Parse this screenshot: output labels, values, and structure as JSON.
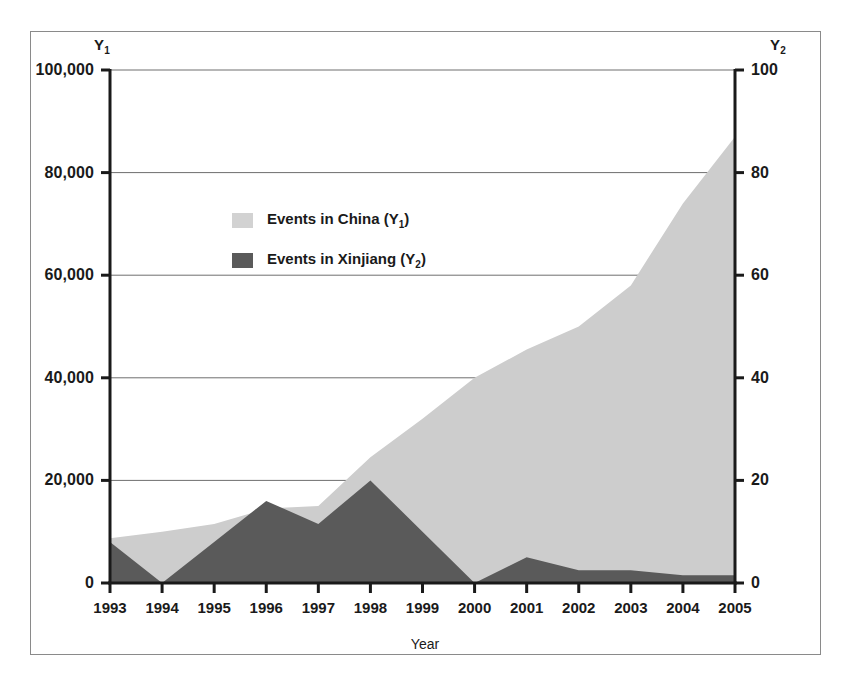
{
  "figure": {
    "background": "#ffffff",
    "frame_color": "#8a8a8a"
  },
  "axes": {
    "y1_title": "Y",
    "y1_title_sub": "1",
    "y2_title": "Y",
    "y2_title_sub": "2",
    "x_label": "Year",
    "y1_ticks": [
      "0",
      "20,000",
      "40,000",
      "60,000",
      "80,000",
      "100,000"
    ],
    "y2_ticks": [
      "0",
      "20",
      "40",
      "60",
      "80",
      "100"
    ],
    "x_ticks": [
      "1993",
      "1994",
      "1995",
      "1996",
      "1997",
      "1998",
      "1999",
      "2000",
      "2001",
      "2002",
      "2003",
      "2004",
      "2005"
    ]
  },
  "legend": {
    "items": [
      {
        "label_prefix": "Events in China (Y",
        "label_sub": "1",
        "label_suffix": ")",
        "color": "#d2d2d2"
      },
      {
        "label_prefix": "Events in Xinjiang (Y",
        "label_sub": "2",
        "label_suffix": ")",
        "color": "#5a5a5a"
      }
    ]
  },
  "colors": {
    "china_fill": "#cdcdcd",
    "xinjiang_fill": "#5a5a5a",
    "axis_line": "#1a1a1a",
    "grid_line": "#6e6e6e"
  },
  "chart_data": {
    "type": "area",
    "title": "",
    "xlabel": "Year",
    "ylabel": "",
    "grid": true,
    "legend_position": "inside-upper-left",
    "x": [
      1993,
      1994,
      1995,
      1996,
      1997,
      1998,
      1999,
      2000,
      2001,
      2002,
      2003,
      2004,
      2005
    ],
    "categories": [
      "1993",
      "1994",
      "1995",
      "1996",
      "1997",
      "1998",
      "1999",
      "2000",
      "2001",
      "2002",
      "2003",
      "2004",
      "2005"
    ],
    "y1_axis": {
      "label": "Y1",
      "ticks": [
        0,
        20000,
        40000,
        60000,
        80000,
        100000
      ],
      "ylim": [
        0,
        100000
      ]
    },
    "y2_axis": {
      "label": "Y2",
      "ticks": [
        0,
        20,
        40,
        60,
        80,
        100
      ],
      "ylim": [
        0,
        100
      ]
    },
    "series": [
      {
        "name": "Events in China (Y1)",
        "axis": "y1",
        "color": "#cdcdcd",
        "values": [
          8700,
          10000,
          11500,
          14500,
          15000,
          24500,
          32000,
          40000,
          45500,
          50000,
          58000,
          74000,
          87000
        ]
      },
      {
        "name": "Events in Xinjiang (Y2)",
        "axis": "y2",
        "color": "#5a5a5a",
        "values": [
          8.0,
          0.0,
          8.0,
          16.0,
          11.5,
          20.0,
          10.0,
          0.0,
          5.0,
          2.5,
          2.5,
          1.5,
          1.5
        ]
      }
    ]
  }
}
